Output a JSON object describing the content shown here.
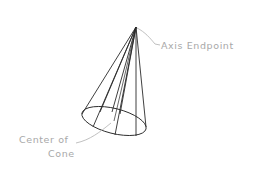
{
  "diagram": {
    "labels": {
      "axis_endpoint": "Axis Endpoint",
      "center_line1": "Center of",
      "center_line2": "Cone"
    },
    "colors": {
      "cone_stroke": "#2a2a2a",
      "leader_stroke": "#b0b0b0",
      "label_text": "#a8a8a8"
    }
  }
}
